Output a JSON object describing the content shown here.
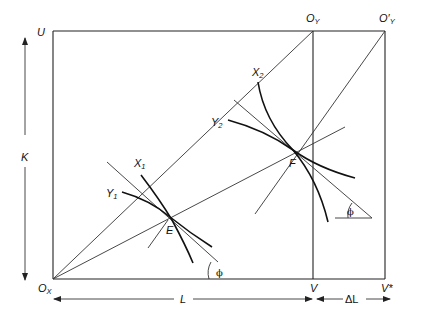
{
  "diagram": {
    "type": "edgeworth-box",
    "labels": {
      "U": "U",
      "K": "K",
      "Ox": "O",
      "Ox_sub": "X",
      "Oy": "O",
      "Oy_sub": "Y",
      "Oy_prime": "O′",
      "Oy_prime_sub": "Y",
      "V": "V",
      "V_star": "V*",
      "L": "L",
      "delta_L": "ΔL",
      "E": "E",
      "F": "F",
      "X1": "X",
      "X1_sub": "1",
      "Y1": "Y",
      "Y1_sub": "1",
      "X2": "X",
      "X2_sub": "2",
      "Y2": "Y",
      "Y2_sub": "2",
      "phi_left": "ϕ",
      "phi_right": "ϕ"
    },
    "points": {
      "U": [
        53,
        31
      ],
      "Ox": [
        53,
        279
      ],
      "Oy": [
        313,
        31
      ],
      "Oy_prime": [
        385,
        31
      ],
      "V": [
        313,
        279
      ],
      "V_star": [
        385,
        279
      ],
      "E": [
        170,
        217
      ],
      "F": [
        293,
        150
      ]
    }
  }
}
